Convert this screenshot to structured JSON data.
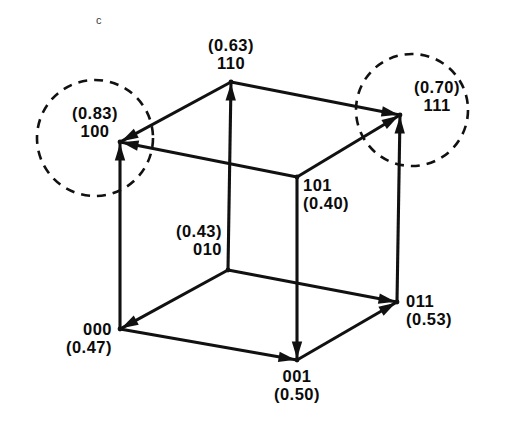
{
  "figure": {
    "panel_letter": "c",
    "stroke_color": "#111111",
    "dashed_circle_color": "#111111",
    "background": "#ffffff"
  },
  "nodes": [
    {
      "id": "110",
      "code": "110",
      "value": "(0.63)",
      "label_order": "value_above",
      "x": 231,
      "y": 82,
      "label_x": 231,
      "label_y": 36,
      "align": "center",
      "highlighted": false
    },
    {
      "id": "111",
      "code": "111",
      "value": "(0.70)",
      "label_order": "value_above",
      "x": 400,
      "y": 115,
      "label_x": 437,
      "label_y": 78,
      "align": "center",
      "highlighted": true
    },
    {
      "id": "100",
      "code": "100",
      "value": "(0.83)",
      "label_order": "value_above",
      "x": 120,
      "y": 142,
      "label_x": 95,
      "label_y": 104,
      "align": "center",
      "highlighted": true
    },
    {
      "id": "101",
      "code": "101",
      "value": "(0.40)",
      "label_order": "code_above",
      "x": 297,
      "y": 177,
      "label_x": 303,
      "label_y": 176,
      "align": "left",
      "highlighted": false
    },
    {
      "id": "010",
      "code": "010",
      "value": "(0.43)",
      "label_order": "value_above",
      "x": 228,
      "y": 270,
      "label_x": 222,
      "label_y": 222,
      "align": "right",
      "highlighted": false
    },
    {
      "id": "011",
      "code": "011",
      "value": "(0.53)",
      "label_order": "code_above",
      "x": 397,
      "y": 302,
      "label_x": 406,
      "label_y": 292,
      "align": "left",
      "highlighted": false
    },
    {
      "id": "000",
      "code": "000",
      "value": "(0.47)",
      "label_order": "code_above",
      "x": 120,
      "y": 329,
      "label_x": 112,
      "label_y": 320,
      "align": "right",
      "highlighted": false
    },
    {
      "id": "001",
      "code": "001",
      "value": "(0.50)",
      "label_order": "code_above",
      "x": 297,
      "y": 360,
      "label_x": 297,
      "label_y": 367,
      "align": "center",
      "highlighted": false
    }
  ],
  "edges": [
    {
      "from": "110",
      "to": "100",
      "arrow": true
    },
    {
      "from": "101",
      "to": "100",
      "arrow": true
    },
    {
      "from": "000",
      "to": "100",
      "arrow": true
    },
    {
      "from": "110",
      "to": "111",
      "arrow": true
    },
    {
      "from": "101",
      "to": "111",
      "arrow": true
    },
    {
      "from": "011",
      "to": "111",
      "arrow": true
    },
    {
      "from": "010",
      "to": "110",
      "arrow": true
    },
    {
      "from": "010",
      "to": "000",
      "arrow": true
    },
    {
      "from": "010",
      "to": "011",
      "arrow": true
    },
    {
      "from": "000",
      "to": "001",
      "arrow": true
    },
    {
      "from": "101",
      "to": "001",
      "arrow": true
    },
    {
      "from": "001",
      "to": "011",
      "arrow": true
    }
  ],
  "highlight_circles": [
    {
      "id": "circle-100",
      "cx": 95,
      "cy": 138,
      "r": 58,
      "target_node": "100"
    },
    {
      "id": "circle-111",
      "cx": 412,
      "cy": 110,
      "r": 56,
      "target_node": "111"
    }
  ],
  "chart_data": {
    "type": "diagram",
    "title": "c",
    "categories": [
      "000",
      "001",
      "010",
      "011",
      "100",
      "101",
      "110",
      "111"
    ],
    "values": [
      0.47,
      0.5,
      0.43,
      0.53,
      0.83,
      0.4,
      0.63,
      0.7
    ],
    "sinks": [
      "100",
      "111"
    ],
    "xlabel": "",
    "ylabel": "",
    "ylim": [
      0,
      1
    ]
  }
}
